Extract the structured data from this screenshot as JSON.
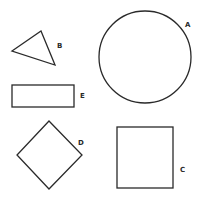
{
  "diagram": {
    "shapes": [
      {
        "id": "A",
        "type": "circle",
        "label": "A"
      },
      {
        "id": "B",
        "type": "triangle",
        "label": "B"
      },
      {
        "id": "C",
        "type": "square",
        "label": "C"
      },
      {
        "id": "D",
        "type": "diamond",
        "label": "D"
      },
      {
        "id": "E",
        "type": "rectangle",
        "label": "E"
      }
    ]
  },
  "colors": {
    "stroke": "#2a2a2a",
    "background": "#ffffff"
  }
}
